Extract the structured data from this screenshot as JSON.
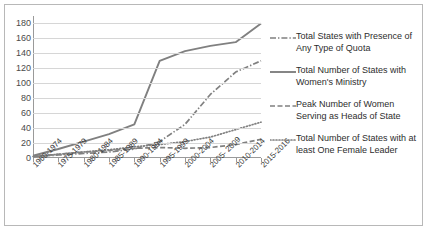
{
  "chart_data": {
    "type": "line",
    "title": "",
    "xlabel": "",
    "ylabel": "",
    "ylim": [
      0,
      190
    ],
    "yticks": [
      0,
      20,
      40,
      60,
      80,
      100,
      120,
      140,
      160,
      180
    ],
    "grid": true,
    "legend_position": "right",
    "categories": [
      "1960-1974",
      "1975-1979",
      "1980-1984",
      "1985-1989",
      "1990-1994",
      "1995-1999",
      "2000-2004",
      "2005- 2009",
      "2010-2014",
      "2015-2016"
    ],
    "series": [
      {
        "name": "Total States with Presence of Any Type of Quota",
        "style": "dash-dot",
        "color": "#808080",
        "values": [
          2,
          4,
          6,
          8,
          12,
          22,
          45,
          85,
          115,
          130
        ]
      },
      {
        "name": "Total Number of States with Women's Ministry",
        "style": "solid",
        "color": "#808080",
        "values": [
          3,
          12,
          22,
          32,
          45,
          130,
          143,
          150,
          155,
          180
        ]
      },
      {
        "name": "Peak Number of Women Serving as Heads of State",
        "style": "dashed",
        "color": "#808080",
        "values": [
          2,
          5,
          8,
          10,
          13,
          14,
          13,
          14,
          18,
          25
        ]
      },
      {
        "name": "Total Number of States with at least One Female Leader",
        "style": "dotted",
        "color": "#808080",
        "values": [
          2,
          5,
          8,
          11,
          15,
          18,
          22,
          28,
          38,
          48
        ]
      }
    ]
  },
  "legend": {
    "items": [
      {
        "label": "Total States with Presence of Any Type of Quota",
        "style": "dash-dot"
      },
      {
        "label": "Total Number of States with Women's Ministry",
        "style": "solid"
      },
      {
        "label": "Peak Number of Women Serving as Heads of State",
        "style": "dashed"
      },
      {
        "label": "Total Number of States with at least One Female Leader",
        "style": "dotted"
      }
    ]
  }
}
